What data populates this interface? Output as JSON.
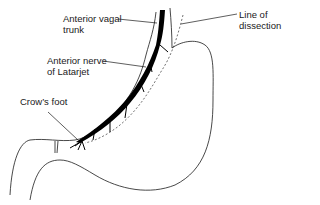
{
  "diagram": {
    "labels": {
      "anterior_vagal_trunk": "Anterior vagal\ntrunk",
      "line_of_dissection": "Line of\ndissection",
      "anterior_nerve_of_latarjet": "Anterior nerve\nof Latarjet",
      "crows_foot": "Crow’s foot"
    },
    "colors": {
      "line": "#1a1a1a",
      "nerve": "#000000",
      "background": "#ffffff"
    }
  }
}
